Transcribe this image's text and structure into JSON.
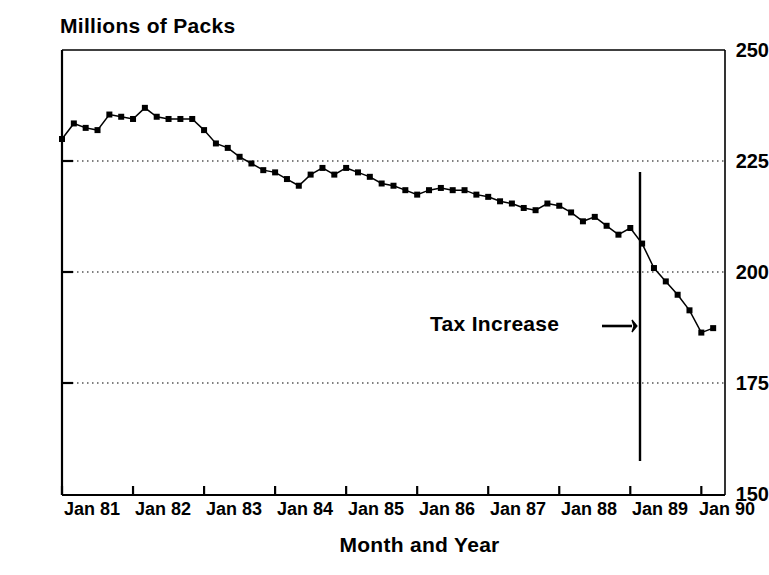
{
  "chart_data": {
    "type": "line",
    "title": "",
    "ylabel": "Millions of Packs",
    "xlabel": "Month and Year",
    "ylim": [
      150,
      250
    ],
    "yticks": [
      250,
      225,
      200,
      175,
      150
    ],
    "ytick_labels": [
      "250",
      "225",
      "200",
      "175",
      "150"
    ],
    "xticks": [
      0,
      12,
      24,
      36,
      48,
      60,
      72,
      84,
      96,
      108
    ],
    "xtick_labels": [
      "Jan 81",
      "Jan 82",
      "Jan 83",
      "Jan 84",
      "Jan 85",
      "Jan 86",
      "Jan 87",
      "Jan 88",
      "Jan 89",
      "Jan 90"
    ],
    "xlim": [
      0,
      112
    ],
    "grid": "horizontal-dotted",
    "gridlines": [
      225,
      200,
      175
    ],
    "legend": "none",
    "marker": "filled-square",
    "line_color": "#000000",
    "series": [
      {
        "name": "Monthly packs sold",
        "x": [
          0,
          2,
          4,
          6,
          8,
          10,
          12,
          14,
          16,
          18,
          20,
          22,
          24,
          26,
          28,
          30,
          32,
          34,
          36,
          38,
          40,
          42,
          44,
          46,
          48,
          50,
          52,
          54,
          56,
          58,
          60,
          62,
          64,
          66,
          68,
          70,
          72,
          74,
          76,
          78,
          80,
          82,
          84,
          86,
          88,
          90,
          92,
          94,
          96,
          98,
          100,
          102,
          104,
          106,
          108,
          110
        ],
        "values": [
          230.0,
          233.5,
          232.5,
          232.0,
          235.5,
          235.0,
          234.5,
          237.0,
          235.0,
          234.5,
          234.5,
          234.5,
          232.0,
          229.0,
          228.0,
          226.0,
          224.5,
          223.0,
          222.5,
          221.0,
          219.5,
          222.0,
          223.5,
          222.0,
          223.5,
          222.5,
          221.5,
          220.0,
          219.5,
          218.5,
          217.5,
          218.5,
          219.0,
          218.5,
          218.5,
          217.5,
          217.0,
          216.0,
          215.5,
          214.5,
          214.0,
          215.5,
          215.0,
          213.5,
          211.5,
          212.5,
          210.5,
          208.5,
          210.0,
          206.5,
          201.0,
          198.0,
          195.0,
          191.5,
          186.5,
          187.5
        ]
      }
    ],
    "annotations": [
      {
        "name": "tax-increase",
        "text": "Tax Increase",
        "arrow": "→",
        "text_x": 430,
        "text_y": 312,
        "arrow_x": 614,
        "arrow_y": 326,
        "vline_x": 96,
        "vline_y_top": 239,
        "vline_y_bottom": 161
      }
    ]
  }
}
